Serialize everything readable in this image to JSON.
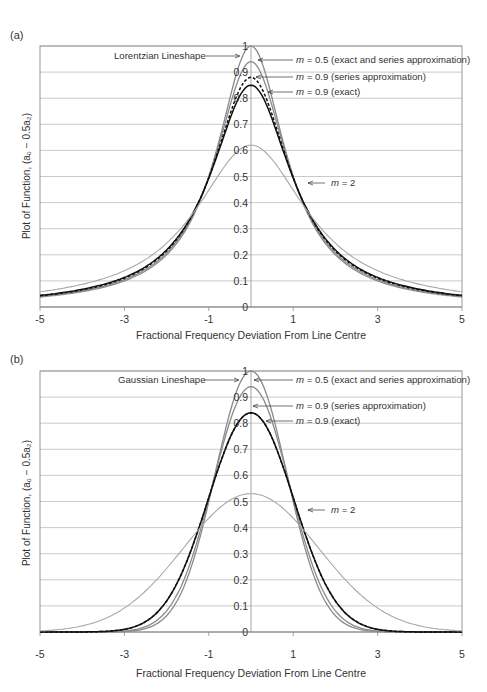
{
  "panels": [
    {
      "label": "(a)",
      "lineshape": "Lorentzian",
      "annotations": {
        "lineshape": "Lorentzian Lineshape",
        "m05_prefix": "m",
        "m05_text": " = 0.5 (exact and series approximation)",
        "m09s_prefix": "m",
        "m09s_text": " = 0.9 (series approximation)",
        "m09e_prefix": "m",
        "m09e_text": " = 0.9 (exact)",
        "m2_prefix": "m",
        "m2_text": " = 2"
      },
      "xlabel": "Fractional Frequency Deviation From Line Centre",
      "ylabel": "Plot of Function, (a₀ − 0.5a₂)"
    },
    {
      "label": "(b)",
      "lineshape": "Gaussian",
      "annotations": {
        "lineshape": "Gaussian Lineshape",
        "m05_prefix": "m",
        "m05_text": " = 0.5 (exact and series approximation)",
        "m09s_prefix": "m",
        "m09s_text": " = 0.9 (series approximation)",
        "m09e_prefix": "m",
        "m09e_text": " = 0.9 (exact)",
        "m2_prefix": "m",
        "m2_text": " = 2"
      },
      "xlabel": "Fractional Frequency Deviation From Line Centre",
      "ylabel": "Plot of Function, (a₀ − 0.5a₂)"
    }
  ],
  "chart_data": [
    {
      "type": "line",
      "title": "(a) Lorentzian Lineshape",
      "xlabel": "Fractional Frequency Deviation From Line Centre",
      "ylabel": "Plot of Function, (a0 - 0.5a2)",
      "xlim": [
        -5,
        5
      ],
      "ylim": [
        0,
        1
      ],
      "x_ticks": [
        -5,
        -3,
        -1,
        1,
        3,
        5
      ],
      "y_ticks": [
        0,
        0.1,
        0.2,
        0.3,
        0.4,
        0.5,
        0.6,
        0.7,
        0.8,
        0.9,
        1
      ],
      "grid": true,
      "legend": "inline annotations with arrows",
      "series": [
        {
          "name": "Lorentzian Lineshape",
          "peak": 1.0,
          "style": "solid grey",
          "x": [
            -5,
            -4,
            -3,
            -2,
            -1,
            -0.5,
            0,
            0.5,
            1,
            2,
            3,
            4,
            5
          ],
          "values": [
            0.038,
            0.059,
            0.1,
            0.2,
            0.5,
            0.8,
            1.0,
            0.8,
            0.5,
            0.2,
            0.1,
            0.059,
            0.038
          ]
        },
        {
          "name": "m = 0.5 (exact and series approximation)",
          "peak": 0.94,
          "style": "solid grey",
          "x": [
            -5,
            -4,
            -3,
            -2,
            -1,
            -0.5,
            0,
            0.5,
            1,
            2,
            3,
            4,
            5
          ],
          "values": [
            0.039,
            0.06,
            0.1,
            0.2,
            0.48,
            0.77,
            0.94,
            0.77,
            0.48,
            0.2,
            0.1,
            0.06,
            0.039
          ]
        },
        {
          "name": "m = 0.9 (series approximation)",
          "peak": 0.88,
          "style": "dashed black",
          "x": [
            -5,
            -4,
            -3,
            -2,
            -1,
            -0.5,
            0,
            0.5,
            1,
            2,
            3,
            4,
            5
          ],
          "values": [
            0.039,
            0.06,
            0.1,
            0.21,
            0.48,
            0.74,
            0.88,
            0.74,
            0.48,
            0.21,
            0.1,
            0.06,
            0.039
          ]
        },
        {
          "name": "m = 0.9 (exact)",
          "peak": 0.85,
          "style": "solid black",
          "x": [
            -5,
            -4,
            -3,
            -2,
            -1,
            -0.5,
            0,
            0.5,
            1,
            2,
            3,
            4,
            5
          ],
          "values": [
            0.039,
            0.06,
            0.1,
            0.21,
            0.47,
            0.72,
            0.85,
            0.72,
            0.47,
            0.21,
            0.1,
            0.06,
            0.039
          ]
        },
        {
          "name": "m = 2",
          "peak": 0.62,
          "style": "solid light grey",
          "x": [
            -5,
            -4,
            -3,
            -2,
            -1,
            -0.5,
            0,
            0.5,
            1,
            2,
            3,
            4,
            5
          ],
          "values": [
            0.04,
            0.065,
            0.12,
            0.26,
            0.5,
            0.59,
            0.62,
            0.59,
            0.5,
            0.26,
            0.12,
            0.065,
            0.04
          ]
        }
      ]
    },
    {
      "type": "line",
      "title": "(b) Gaussian Lineshape",
      "xlabel": "Fractional Frequency Deviation From Line Centre",
      "ylabel": "Plot of Function, (a0 - 0.5a2)",
      "xlim": [
        -5,
        5
      ],
      "ylim": [
        0,
        1
      ],
      "x_ticks": [
        -5,
        -3,
        -1,
        1,
        3,
        5
      ],
      "y_ticks": [
        0,
        0.1,
        0.2,
        0.3,
        0.4,
        0.5,
        0.6,
        0.7,
        0.8,
        0.9,
        1
      ],
      "grid": true,
      "legend": "inline annotations with arrows",
      "series": [
        {
          "name": "Gaussian Lineshape",
          "peak": 1.0,
          "style": "solid grey",
          "x": [
            -3,
            -2,
            -1.5,
            -1,
            -0.5,
            0,
            0.5,
            1,
            1.5,
            2,
            3
          ],
          "values": [
            0.0,
            0.02,
            0.11,
            0.37,
            0.78,
            1.0,
            0.78,
            0.37,
            0.11,
            0.02,
            0.0
          ]
        },
        {
          "name": "m = 0.5 (exact and series approximation)",
          "peak": 0.94,
          "style": "solid grey",
          "x": [
            -3,
            -2,
            -1.5,
            -1,
            -0.5,
            0,
            0.5,
            1,
            1.5,
            2,
            3
          ],
          "values": [
            0.0,
            0.025,
            0.12,
            0.38,
            0.75,
            0.94,
            0.75,
            0.38,
            0.12,
            0.025,
            0.0
          ]
        },
        {
          "name": "m = 0.9 (series approximation)",
          "peak": 0.84,
          "style": "dashed black",
          "x": [
            -3,
            -2,
            -1.5,
            -1,
            -0.5,
            0,
            0.5,
            1,
            1.5,
            2,
            3
          ],
          "values": [
            0.005,
            0.04,
            0.15,
            0.4,
            0.71,
            0.84,
            0.71,
            0.4,
            0.15,
            0.04,
            0.005
          ]
        },
        {
          "name": "m = 0.9 (exact)",
          "peak": 0.84,
          "style": "solid black",
          "x": [
            -3,
            -2,
            -1.5,
            -1,
            -0.5,
            0,
            0.5,
            1,
            1.5,
            2,
            3
          ],
          "values": [
            0.005,
            0.04,
            0.15,
            0.4,
            0.71,
            0.84,
            0.71,
            0.4,
            0.15,
            0.04,
            0.005
          ]
        },
        {
          "name": "m = 2",
          "peak": 0.53,
          "style": "solid light grey",
          "x": [
            -4,
            -3,
            -2,
            -1.5,
            -1,
            -0.5,
            0,
            0.5,
            1,
            1.5,
            2,
            3,
            4
          ],
          "values": [
            0.005,
            0.05,
            0.2,
            0.31,
            0.42,
            0.5,
            0.53,
            0.5,
            0.42,
            0.31,
            0.2,
            0.05,
            0.005
          ]
        }
      ]
    }
  ]
}
